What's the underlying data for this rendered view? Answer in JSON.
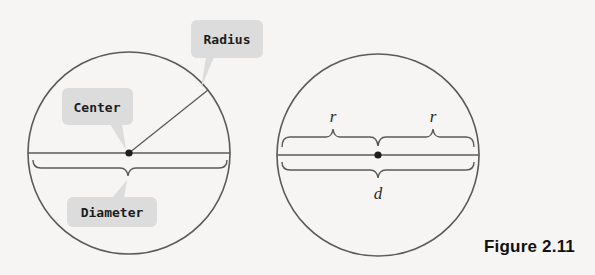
{
  "figure": {
    "caption": "Figure 2.11",
    "colors": {
      "background": "#f6f5f3",
      "stroke": "#5a5a5a",
      "callout_fill": "#dcdcdc",
      "dot": "#1e1e1e"
    }
  },
  "left_circle": {
    "labels": {
      "center": "Center",
      "radius": "Radius",
      "diameter": "Diameter"
    }
  },
  "right_circle": {
    "labels": {
      "radius_left": "r",
      "radius_right": "r",
      "diameter": "d"
    }
  }
}
